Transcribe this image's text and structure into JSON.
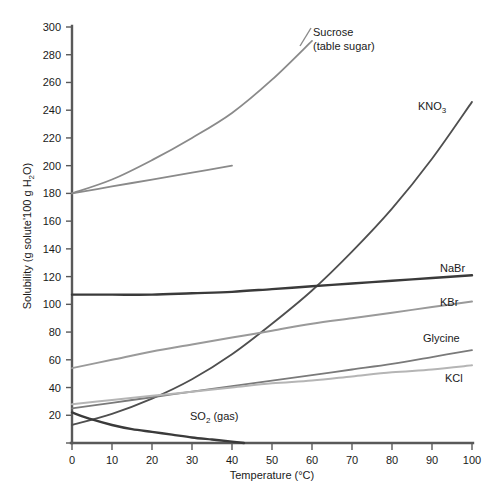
{
  "chart_data": {
    "type": "line",
    "title": "",
    "xlabel": "Temperature (°C)",
    "ylabel": "Solubility (g solute/100 g H₂O)",
    "ylabel_parts": {
      "pre": "Solubility (g solute'100 g H",
      "sub": "2",
      "post": "O)"
    },
    "xlim": [
      0,
      100
    ],
    "ylim": [
      0,
      300
    ],
    "xticks": [
      0,
      10,
      20,
      30,
      40,
      50,
      60,
      70,
      80,
      90,
      100
    ],
    "yticks": [
      0,
      20,
      40,
      60,
      80,
      100,
      120,
      140,
      160,
      180,
      200,
      220,
      240,
      260,
      280,
      300
    ],
    "grid": false,
    "legend": "inline-curve-labels",
    "series": [
      {
        "name": "Sucrose (table sugar)",
        "label_line1": "Sucrose",
        "label_line2": "(table sugar)",
        "color": "#8a8a8a",
        "width": 1.8,
        "x": [
          0,
          10,
          20,
          30,
          40,
          50,
          60
        ],
        "values": [
          180,
          190,
          204,
          220,
          238,
          262,
          290
        ]
      },
      {
        "name": "Sucrose lower branch",
        "label_line1": "",
        "label_line2": "",
        "color": "#8a8a8a",
        "width": 1.8,
        "x": [
          0,
          10,
          20,
          30,
          40
        ],
        "values": [
          180,
          185,
          190,
          195,
          200
        ]
      },
      {
        "name": "KNO3",
        "label_line1": "KNO",
        "sub": "3",
        "color": "#4f4f4f",
        "width": 1.8,
        "x": [
          0,
          10,
          20,
          30,
          40,
          50,
          60,
          70,
          80,
          90,
          100
        ],
        "values": [
          13,
          21,
          32,
          46,
          64,
          86,
          110,
          138,
          169,
          205,
          246
        ]
      },
      {
        "name": "NaBr",
        "label_line1": "NaBr",
        "color": "#3a3a3a",
        "width": 2.4,
        "x": [
          0,
          10,
          20,
          30,
          40,
          50,
          60,
          70,
          80,
          90,
          100
        ],
        "values": [
          107,
          107,
          107,
          108,
          109,
          111,
          113,
          115,
          117,
          119,
          121
        ]
      },
      {
        "name": "KBr",
        "label_line1": "KBr",
        "color": "#9a9a9a",
        "width": 2.0,
        "x": [
          0,
          10,
          20,
          30,
          40,
          50,
          60,
          70,
          80,
          90,
          100
        ],
        "values": [
          54,
          60,
          66,
          71,
          76,
          81,
          86,
          90,
          94,
          98,
          102
        ]
      },
      {
        "name": "Glycine",
        "label_line1": "Glycine",
        "color": "#7a7a7a",
        "width": 1.8,
        "x": [
          0,
          10,
          20,
          30,
          40,
          50,
          60,
          70,
          80,
          90,
          100
        ],
        "values": [
          25,
          29,
          33,
          37,
          41,
          45,
          49,
          53,
          57,
          62,
          67
        ]
      },
      {
        "name": "KCl",
        "label_line1": "KCl",
        "color": "#b5b5b5",
        "width": 2.0,
        "x": [
          0,
          10,
          20,
          30,
          40,
          50,
          60,
          70,
          80,
          90,
          100
        ],
        "values": [
          28,
          31,
          34,
          37,
          40,
          43,
          45,
          48,
          51,
          53,
          56
        ]
      },
      {
        "name": "SO2 (gas)",
        "label_line1": "SO",
        "sub": "2",
        "label_line2": " (gas)",
        "color": "#3a3a3a",
        "width": 2.4,
        "x": [
          0,
          5,
          10,
          15,
          20,
          25,
          30,
          35,
          40,
          43
        ],
        "values": [
          22,
          17,
          13,
          10,
          8,
          6,
          4,
          2.5,
          1,
          0
        ]
      }
    ],
    "annotations": [
      {
        "name": "sucrose-label",
        "text_line1": "Sucrose",
        "text_line2": "(table sugar)",
        "x": 313,
        "y": 36
      },
      {
        "name": "kno3-label",
        "text": "KNO",
        "sub": "3",
        "x": 418,
        "y": 110
      },
      {
        "name": "nabr-label",
        "text": "NaBr",
        "x": 440,
        "y": 272
      },
      {
        "name": "kbr-label",
        "text": "KBr",
        "x": 440,
        "y": 306
      },
      {
        "name": "glycine-label",
        "text": "Glycine",
        "x": 423,
        "y": 342
      },
      {
        "name": "kcl-label",
        "text": "KCl",
        "x": 445,
        "y": 382
      },
      {
        "name": "so2-label",
        "text": "SO",
        "sub": "2",
        "post": " (gas)",
        "x": 190,
        "y": 420
      }
    ]
  }
}
